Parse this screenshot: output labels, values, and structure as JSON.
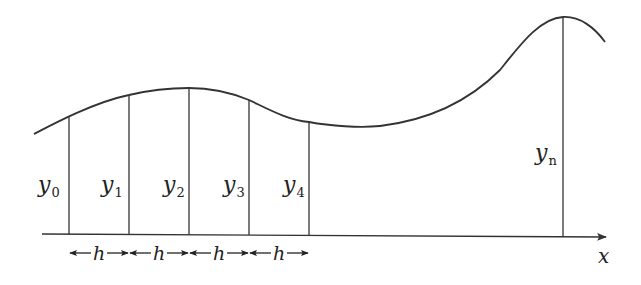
{
  "diagram": {
    "type": "trapezoidal-rule-ordinates",
    "axis_label": "x",
    "interval_label": "h",
    "colors": {
      "stroke": "#333333",
      "text": "#222222",
      "background": "#ffffff"
    },
    "ordinates": [
      {
        "base": "y",
        "sub": "0",
        "x": 69,
        "top": 116,
        "label_x": 38,
        "label_y": 192
      },
      {
        "base": "y",
        "sub": "1",
        "x": 129,
        "top": 95,
        "label_x": 101,
        "label_y": 192
      },
      {
        "base": "y",
        "sub": "2",
        "x": 189,
        "top": 88,
        "label_x": 163,
        "label_y": 192
      },
      {
        "base": "y",
        "sub": "3",
        "x": 249,
        "top": 100,
        "label_x": 223,
        "label_y": 192
      },
      {
        "base": "y",
        "sub": "4",
        "x": 309,
        "top": 122,
        "label_x": 283,
        "label_y": 192
      },
      {
        "base": "y",
        "sub": "n",
        "x": 563,
        "top": 17,
        "label_x": 535,
        "label_y": 160
      }
    ],
    "intervals": [
      {
        "label": "h",
        "from": 69,
        "to": 129
      },
      {
        "label": "h",
        "from": 129,
        "to": 189
      },
      {
        "label": "h",
        "from": 189,
        "to": 249
      },
      {
        "label": "h",
        "from": 249,
        "to": 309
      }
    ]
  }
}
